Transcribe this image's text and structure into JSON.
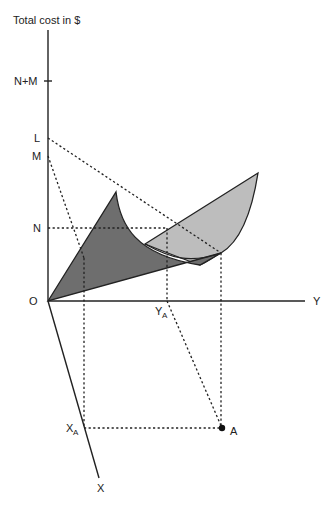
{
  "diagram": {
    "title": "Total cost in $",
    "axes": {
      "vertical": "Total cost in $",
      "y_axis": "Y",
      "x_axis": "X",
      "origin": "O"
    },
    "vertical_ticks": [
      "N+M",
      "L",
      "M",
      "N"
    ],
    "labels": {
      "n_plus_m": "N+M",
      "l": "L",
      "m": "M",
      "n": "N",
      "origin": "O",
      "y": "Y",
      "x": "X",
      "y_a_main": "Y",
      "y_a_sub": "A",
      "x_a_main": "X",
      "x_a_sub": "A",
      "point_a": "A"
    },
    "surfaces": [
      {
        "name": "dark-cost-surface",
        "color": "#6e6e6e"
      },
      {
        "name": "light-cost-surface",
        "color": "#bdbdbd"
      }
    ],
    "colors": {
      "line": "#222222",
      "dark_fill": "#6e6e6e",
      "light_fill": "#bdbdbd",
      "background": "#ffffff"
    }
  }
}
